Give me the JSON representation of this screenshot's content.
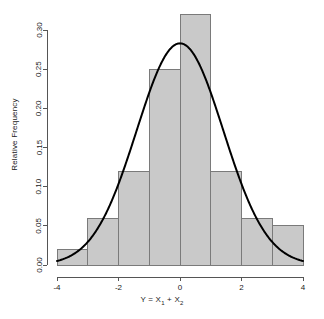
{
  "chart_data": {
    "type": "bar",
    "title": "",
    "subtitle": "",
    "xlabel": "Y = X1 + X2",
    "xlabel_parts": {
      "lead": "Y = X",
      "sub1": "1",
      "mid": " + X",
      "sub2": "2"
    },
    "ylabel": "Relative Frequency",
    "categories": [
      "-4 to -3",
      "-3 to -2",
      "-2 to -1",
      "-1 to 0",
      "0 to 1",
      "1 to 2",
      "2 to 3",
      "3 to 4"
    ],
    "bin_edges": [
      -4,
      -3,
      -2,
      -1,
      0,
      1,
      2,
      3,
      4
    ],
    "values": [
      0.02,
      0.06,
      0.12,
      0.25,
      0.32,
      0.12,
      0.06,
      0.05
    ],
    "xlim": [
      -4,
      4
    ],
    "ylim": [
      0,
      0.32
    ],
    "xticks": [
      -4,
      -2,
      0,
      2,
      4
    ],
    "xtick_labels": [
      "-4",
      "-2",
      "0",
      "2",
      "4"
    ],
    "yticks": [
      0.0,
      0.05,
      0.1,
      0.15,
      0.2,
      0.25,
      0.3
    ],
    "ytick_labels": [
      "0.00",
      "0.05",
      "0.10",
      "0.15",
      "0.20",
      "0.25",
      "0.30"
    ],
    "grid": false,
    "legend": null,
    "bar_fill_color": "#c9c9c9",
    "bar_border_color": "#7a7a7a",
    "curve_color": "#000000",
    "axis_color": "#555555",
    "overlay_curve": {
      "name": "normal density",
      "type": "line",
      "mean": 0,
      "sd": 1.41,
      "peak_value": 0.283,
      "peak_x": 0
    }
  }
}
